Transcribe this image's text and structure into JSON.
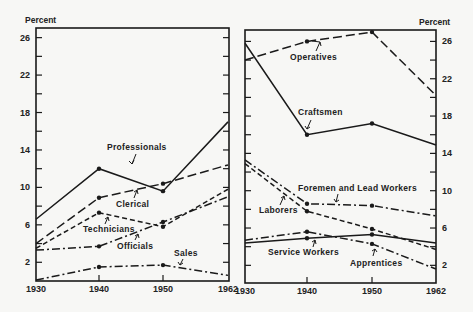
{
  "chart_data": [
    {
      "type": "line",
      "panel": "left",
      "ylabel": "Percent",
      "x": [
        1930,
        1940,
        1950,
        1962
      ],
      "x_tick_labels": [
        "1930",
        "1940",
        "1950",
        "1962"
      ],
      "y_tick_labels": [
        "26",
        "22",
        "18",
        "14",
        "10",
        "6",
        "2"
      ],
      "ylim": [
        0,
        27
      ],
      "grid": false,
      "series": [
        {
          "name": "Professionals",
          "style": "solid",
          "values": [
            6.6,
            12.0,
            9.6,
            17.0
          ]
        },
        {
          "name": "Clerical",
          "style": "long-dash",
          "values": [
            4.0,
            8.9,
            10.4,
            12.4
          ]
        },
        {
          "name": "Technicians",
          "style": "short-dash",
          "values": [
            3.5,
            7.3,
            5.8,
            9.8
          ]
        },
        {
          "name": "Officials",
          "style": "dash-dot",
          "values": [
            3.3,
            3.7,
            6.3,
            9.0
          ]
        },
        {
          "name": "Sales",
          "style": "dash-dot",
          "values": [
            0.1,
            1.5,
            1.7,
            0.6
          ]
        }
      ]
    },
    {
      "type": "line",
      "panel": "right",
      "ylabel": "Percent",
      "x": [
        1930,
        1940,
        1950,
        1962
      ],
      "x_tick_labels": [
        "1930",
        "1940",
        "1950",
        "1962"
      ],
      "y_tick_labels": [
        "26",
        "22",
        "18",
        "14",
        "10",
        "6",
        "2"
      ],
      "ylim": [
        0,
        27
      ],
      "grid": false,
      "series": [
        {
          "name": "Operatives",
          "style": "long-dash",
          "values": [
            24.0,
            26.0,
            27.0,
            20.2
          ]
        },
        {
          "name": "Craftsmen",
          "style": "solid",
          "values": [
            25.8,
            16.0,
            17.2,
            14.9
          ]
        },
        {
          "name": "Foremen and Lead Workers",
          "style": "dash-dot",
          "values": [
            13.3,
            8.6,
            8.4,
            7.3
          ]
        },
        {
          "name": "Laborers",
          "style": "short-dash",
          "values": [
            12.9,
            7.8,
            5.9,
            3.7
          ]
        },
        {
          "name": "Service Workers",
          "style": "solid",
          "values": [
            4.4,
            4.9,
            5.3,
            4.4
          ]
        },
        {
          "name": "Apprentices",
          "style": "dash-dot",
          "values": [
            4.7,
            5.6,
            4.3,
            1.6
          ]
        }
      ]
    }
  ],
  "labels": {
    "left_ylabel": "Percent",
    "right_ylabel": "Percent",
    "professionals": "Professionals",
    "clerical": "Clerical",
    "technicians": "Technicians",
    "officials": "Officials",
    "sales": "Sales",
    "operatives": "Operatives",
    "craftsmen": "Craftsmen",
    "foremen": "Foremen and Lead Workers",
    "laborers": "Laborers",
    "service": "Service Workers",
    "apprentices": "Apprentices"
  },
  "colors": {
    "background": "#f7f7f5",
    "ink": "#1a1a1a"
  }
}
